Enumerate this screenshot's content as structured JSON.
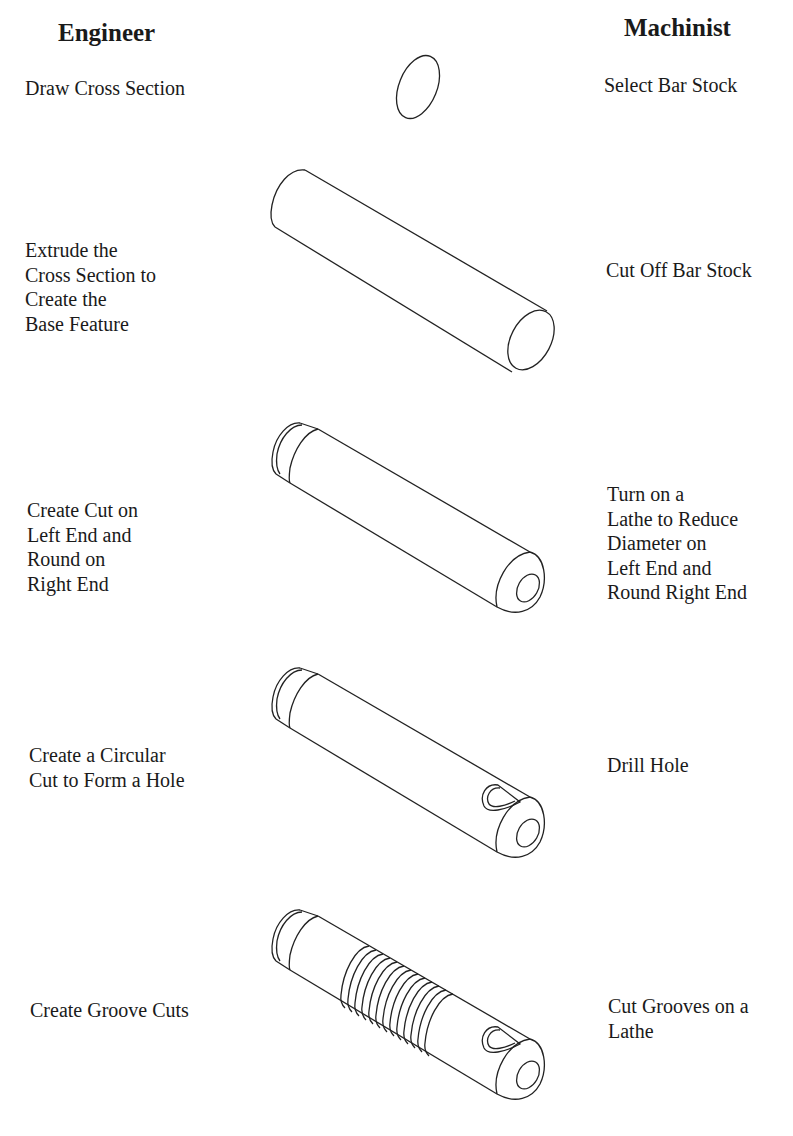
{
  "columns": {
    "engineer": {
      "heading": "Engineer"
    },
    "machinist": {
      "heading": "Machinist"
    }
  },
  "steps": [
    {
      "engineer": "Draw Cross Section",
      "machinist": "Select Bar Stock",
      "figure": "circular-cross-section"
    },
    {
      "engineer": "Extrude the\nCross Section to\nCreate the\nBase Feature",
      "machinist": "Cut Off Bar Stock",
      "figure": "plain-cylinder"
    },
    {
      "engineer": "Create Cut on\nLeft End and\nRound on\nRight End",
      "machinist": "Turn on a\nLathe to Reduce\nDiameter on\nLeft End and\nRound Right End",
      "figure": "cylinder-stepped-rounded"
    },
    {
      "engineer": "Create a Circular\nCut to Form a Hole",
      "machinist": "Drill Hole",
      "figure": "cylinder-with-cross-hole"
    },
    {
      "engineer": "Create Groove Cuts",
      "machinist": "Cut Grooves on a\nLathe",
      "figure": "cylinder-with-grooves"
    }
  ],
  "colors": {
    "line": "#222222",
    "text": "#1a1a1a",
    "background": "#ffffff"
  }
}
